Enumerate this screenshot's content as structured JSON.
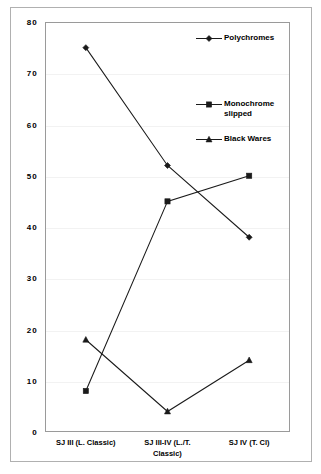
{
  "chart_data": {
    "type": "line",
    "title": "",
    "xlabel": "",
    "ylabel": "",
    "categories": [
      "SJ III (L. Classic)",
      "SJ III-IV (L./T.\nClassic)",
      "SJ IV (T. Cl)"
    ],
    "series": [
      {
        "name": "Polychromes",
        "marker": "diamond",
        "values": [
          75,
          52,
          38
        ]
      },
      {
        "name": "Monochrome\nslipped",
        "marker": "square",
        "values": [
          8,
          45,
          50
        ]
      },
      {
        "name": "Black Wares",
        "marker": "triangle",
        "values": [
          18,
          4,
          14
        ]
      }
    ],
    "ylim": [
      0,
      80
    ],
    "ytick_values": [
      0,
      10,
      20,
      30,
      40,
      50,
      60,
      70,
      80
    ],
    "ytick_labels": [
      "0",
      "10",
      "20",
      "30",
      "40",
      "50",
      "60",
      "70",
      "80"
    ],
    "grid": true,
    "grid_color": "#f2f2f2",
    "legend_position": "top-right",
    "line_color": "#1a1a1a",
    "plot_background": "#ffffff",
    "frame_color": "#9a9a9a",
    "outer_frame_color": "#b0b0b0"
  },
  "legend": {
    "entries": [
      {
        "label": "Polychromes",
        "marker": "diamond-marker-icon"
      },
      {
        "label": "Monochrome\nslipped",
        "marker": "square-marker-icon"
      },
      {
        "label": "Black Wares",
        "marker": "triangle-marker-icon"
      }
    ]
  }
}
